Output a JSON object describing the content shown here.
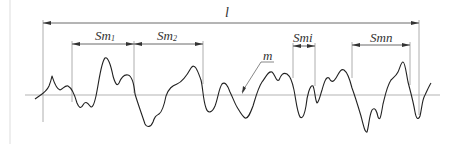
{
  "diagram": {
    "labels": {
      "sampling_length": "l",
      "mean_line": "m",
      "spacings": [
        {
          "main": "Sm",
          "sub": "1"
        },
        {
          "main": "Sm",
          "sub": "2"
        },
        {
          "main": "Sm",
          "sub": "i"
        },
        {
          "main": "Sm",
          "sub": "n"
        }
      ]
    },
    "colors": {
      "profile": "#222222",
      "guides": "#888888",
      "mean_line": "#aaaaaa",
      "text": "#333333"
    }
  }
}
